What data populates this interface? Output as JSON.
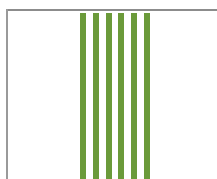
{
  "chart_data": {
    "type": "bar",
    "title": "",
    "xlabel": "",
    "ylabel": "",
    "categories": [
      "1",
      "2",
      "3",
      "4",
      "5",
      "6"
    ],
    "values": [
      1,
      1,
      1,
      1,
      1,
      1
    ],
    "grid": false,
    "legend": null,
    "bar_color": "#6b9a3a",
    "axis_color": "#8c8c8c",
    "bar_positions_px": [
      80,
      93,
      106,
      118,
      131,
      144
    ],
    "bar_width_px": 6
  }
}
